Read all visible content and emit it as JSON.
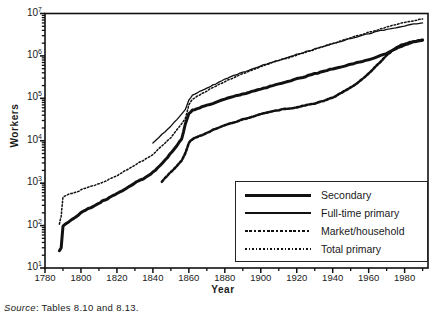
{
  "chart_data": {
    "type": "line",
    "title": "",
    "xlabel": "Year",
    "ylabel": "Workers",
    "xlim": [
      1780,
      1993
    ],
    "ylim": [
      10,
      10000000
    ],
    "yscale": "log",
    "grid": false,
    "legend_position": "bottom-right",
    "xticks": [
      1780,
      1800,
      1820,
      1840,
      1860,
      1880,
      1900,
      1920,
      1940,
      1960,
      1980
    ],
    "yticks": [
      "10¹",
      "10²",
      "10³",
      "10⁴",
      "10⁵",
      "10⁶",
      "10⁷"
    ],
    "ytick_values": [
      10,
      100,
      1000,
      10000,
      100000,
      1000000,
      10000000
    ],
    "series": [
      {
        "name": "Secondary",
        "style": "thick-solid",
        "color": "#111111",
        "x": [
          1788,
          1789,
          1790,
          1791,
          1793,
          1796,
          1800,
          1804,
          1808,
          1812,
          1816,
          1820,
          1824,
          1828,
          1832,
          1836,
          1840,
          1844,
          1848,
          1852,
          1856,
          1858,
          1860,
          1862,
          1866,
          1870,
          1875,
          1880,
          1885,
          1890,
          1895,
          1900,
          1905,
          1910,
          1915,
          1920,
          1925,
          1930,
          1935,
          1940,
          1945,
          1950,
          1955,
          1960,
          1965,
          1970,
          1975,
          1980,
          1985,
          1990
        ],
        "y": [
          26,
          30,
          95,
          105,
          120,
          150,
          200,
          250,
          300,
          380,
          460,
          560,
          700,
          900,
          1150,
          1350,
          1800,
          2600,
          4000,
          6500,
          11000,
          24000,
          43000,
          52000,
          60000,
          68000,
          80000,
          95000,
          110000,
          125000,
          145000,
          165000,
          190000,
          215000,
          250000,
          290000,
          330000,
          380000,
          430000,
          500000,
          560000,
          640000,
          720000,
          820000,
          950000,
          1150000,
          1450000,
          1850000,
          2150000,
          2350000
        ]
      },
      {
        "name": "Full-time primary",
        "style": "thin-solid",
        "color": "#111111",
        "x": [
          1840,
          1845,
          1850,
          1855,
          1858,
          1860,
          1862,
          1866,
          1870,
          1875,
          1880,
          1885,
          1890,
          1895,
          1900,
          1905,
          1910,
          1915,
          1920,
          1925,
          1930,
          1935,
          1940,
          1945,
          1950,
          1955,
          1960,
          1965,
          1970,
          1975,
          1980,
          1985,
          1990
        ],
        "y": [
          9000,
          14000,
          22000,
          38000,
          55000,
          90000,
          120000,
          145000,
          175000,
          220000,
          280000,
          340000,
          410000,
          490000,
          580000,
          680000,
          790000,
          920000,
          1080000,
          1250000,
          1450000,
          1700000,
          1950000,
          2250000,
          2600000,
          2950000,
          3350000,
          3800000,
          4200000,
          4600000,
          5100000,
          5600000,
          6000000
        ]
      },
      {
        "name": "Market/household",
        "style": "dotted-thick",
        "color": "#111111",
        "x": [
          1845,
          1848,
          1852,
          1856,
          1858,
          1860,
          1862,
          1866,
          1870,
          1875,
          1880,
          1885,
          1890,
          1895,
          1900,
          1905,
          1910,
          1915,
          1920,
          1925,
          1930,
          1935,
          1940,
          1945,
          1950,
          1955,
          1960,
          1965,
          1970,
          1975,
          1980,
          1985,
          1990
        ],
        "y": [
          1100,
          1500,
          2200,
          3400,
          5000,
          9000,
          11000,
          13000,
          15500,
          19000,
          23000,
          27000,
          32000,
          37000,
          43000,
          48000,
          53000,
          57000,
          62000,
          68000,
          76000,
          88000,
          105000,
          135000,
          180000,
          250000,
          380000,
          620000,
          1050000,
          1550000,
          1950000,
          2200000,
          2400000
        ]
      },
      {
        "name": "Total primary",
        "style": "dotted-thin",
        "color": "#111111",
        "x": [
          1788,
          1789,
          1790,
          1792,
          1795,
          1798,
          1800,
          1804,
          1808,
          1812,
          1816,
          1820,
          1824,
          1828,
          1832,
          1836,
          1840,
          1845,
          1850,
          1855,
          1858,
          1860,
          1862,
          1866,
          1870,
          1875,
          1880,
          1885,
          1890,
          1895,
          1900,
          1905,
          1910,
          1915,
          1920,
          1925,
          1930,
          1935,
          1940,
          1945,
          1950,
          1955,
          1960,
          1965,
          1970,
          1975,
          1980,
          1985,
          1990
        ],
        "y": [
          110,
          170,
          480,
          520,
          580,
          620,
          700,
          800,
          900,
          1050,
          1250,
          1500,
          1900,
          2400,
          3000,
          3700,
          4800,
          7500,
          12000,
          22000,
          33000,
          70000,
          95000,
          120000,
          150000,
          195000,
          250000,
          310000,
          380000,
          460000,
          560000,
          660000,
          780000,
          900000,
          1050000,
          1220000,
          1420000,
          1680000,
          1950000,
          2300000,
          2700000,
          3100000,
          3600000,
          4100000,
          4800000,
          5500000,
          6200000,
          6800000,
          7400000
        ]
      }
    ]
  },
  "legend": {
    "items": [
      {
        "label": "Secondary",
        "style": "thick-solid"
      },
      {
        "label": "Full-time primary",
        "style": "thin-solid"
      },
      {
        "label": "Market/household",
        "style": "dotted-thick"
      },
      {
        "label": "Total primary",
        "style": "dotted-thin"
      }
    ]
  },
  "axes": {
    "ylabel": "Workers",
    "xlabel": "Year"
  },
  "footer": {
    "source_word": "Source",
    "source_rest": ": Tables 8.10 and 8.13."
  }
}
